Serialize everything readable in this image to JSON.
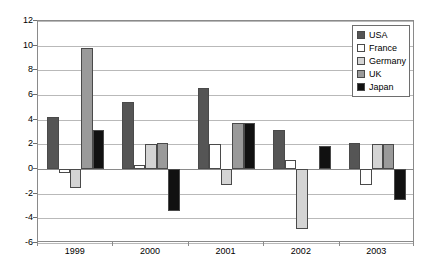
{
  "chart_data": {
    "type": "bar",
    "title": "",
    "subtitle": "",
    "xlabel": "",
    "ylabel": "",
    "categories": [
      "1999",
      "2000",
      "2001",
      "2002",
      "2003"
    ],
    "series": [
      {
        "name": "USA",
        "color": "#555555",
        "values": [
          4.2,
          5.4,
          6.6,
          3.2,
          2.1
        ]
      },
      {
        "name": "France",
        "color": "#ffffff",
        "values": [
          -0.3,
          0.3,
          2.0,
          0.7,
          -1.3
        ]
      },
      {
        "name": "Germany",
        "color": "#d4d4d4",
        "values": [
          -1.5,
          2.0,
          -1.3,
          -4.9,
          2.0
        ]
      },
      {
        "name": "UK",
        "color": "#9a9a9a",
        "values": [
          9.8,
          2.1,
          3.7,
          null,
          2.0
        ]
      },
      {
        "name": "Japan",
        "color": "#111111",
        "values": [
          3.2,
          -3.4,
          3.7,
          1.9,
          -2.5
        ]
      }
    ],
    "ylim": [
      -6,
      12
    ],
    "yticks": [
      12,
      10,
      8,
      6,
      4,
      2,
      0,
      -2,
      -4,
      -6
    ],
    "ytick_labels": [
      "12",
      "10",
      "8",
      "6",
      "4",
      "2",
      "0",
      "-2",
      "-4",
      "-6"
    ],
    "grid": true,
    "grid_axis": "y",
    "legend_position": "top-right",
    "zero_line": 0,
    "bar_outline_color": "#4a4a4a",
    "gridline_color": "#b9b9b9",
    "axis_color": "#8a8a8a",
    "background_color": "#ffffff"
  },
  "legend": {
    "items": [
      {
        "label": "USA"
      },
      {
        "label": "France"
      },
      {
        "label": "Germany"
      },
      {
        "label": "UK"
      },
      {
        "label": "Japan"
      }
    ]
  }
}
